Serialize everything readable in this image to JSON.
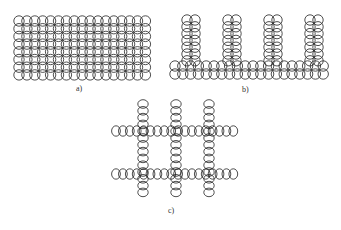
{
  "figure": {
    "panels": [
      {
        "id": "a",
        "label": "a)",
        "description": "dense rectangular grid of overlapping circles",
        "cols": 17,
        "rows": 8
      },
      {
        "id": "b",
        "label": "b)",
        "description": "comb structure: 2-row horizontal base of circles with 4 vertical double-column teeth",
        "base_cols": 20,
        "base_rows": 2,
        "teeth": 4,
        "teeth_height": 7
      },
      {
        "id": "c",
        "label": "c)",
        "description": "lattice of circles: 2 horizontal rows crossing 3 vertical columns",
        "h_rows": 2,
        "v_cols": 3
      }
    ]
  }
}
